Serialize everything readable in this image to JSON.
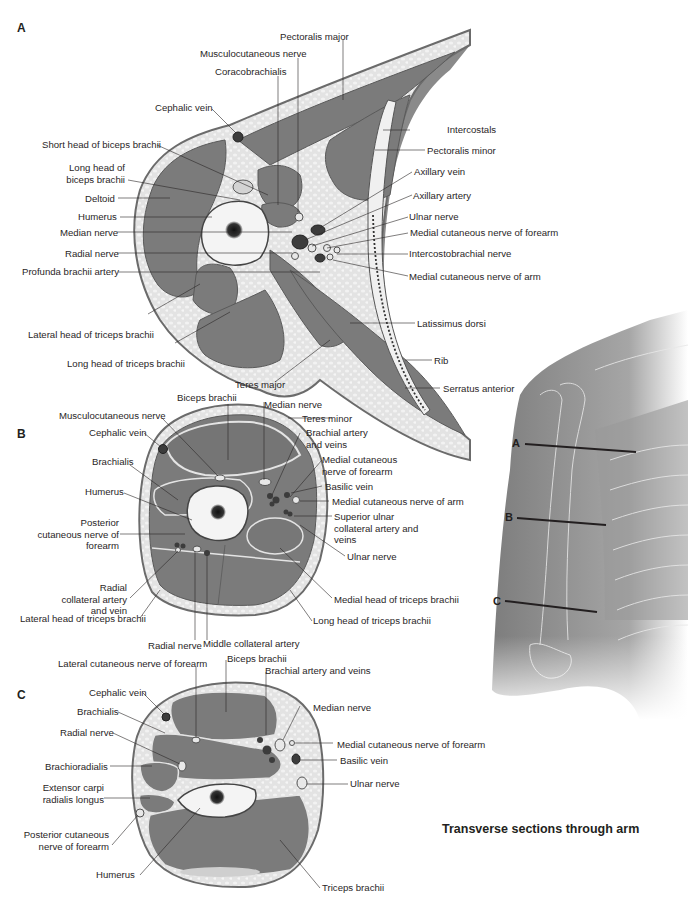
{
  "figure": {
    "title": "Transverse sections through arm",
    "colors": {
      "muscle": "#7b7b7b",
      "muscle_dark": "#6e6e6e",
      "fat": "#d9d9d9",
      "skin": "#8a8a8a",
      "bone": "#f4f4f4",
      "marrow": "#1f1f1f",
      "vessel": "#3c3c3c",
      "nerve": "#e8e8e8",
      "arm_skin": "#8c8c8c"
    }
  },
  "section_a": {
    "letter": "A",
    "labels": {
      "pectoralis_major": "Pectoralis major",
      "musculocutaneous_nerve": "Musculocutaneous nerve",
      "coracobrachialis": "Coracobrachialis",
      "cephalic_vein": "Cephalic vein",
      "short_head_biceps": "Short head of biceps brachii",
      "long_head_biceps": "Long head of biceps brachii",
      "deltoid": "Deltoid",
      "humerus": "Humerus",
      "median_nerve": "Median nerve",
      "radial_nerve": "Radial nerve",
      "profunda_brachii_artery": "Profunda brachii artery",
      "lateral_head_triceps": "Lateral head of triceps brachii",
      "long_head_triceps": "Long head of triceps brachii",
      "teres_major": "Teres major",
      "intercostals": "Intercostals",
      "pectoralis_minor": "Pectoralis minor",
      "axillary_vein": "Axillary vein",
      "axillary_artery": "Axillary artery",
      "ulnar_nerve": "Ulnar nerve",
      "medial_cutaneous_nerve_forearm": "Medial cutaneous nerve of forearm",
      "intercostobrachial_nerve": "Intercostobrachial nerve",
      "medial_cutaneous_nerve_arm": "Medial cutaneous nerve of arm",
      "latissimus_dorsi": "Latissimus dorsi",
      "rib": "Rib",
      "serratus_anterior": "Serratus anterior"
    }
  },
  "section_b": {
    "letter": "B",
    "labels": {
      "biceps_brachii": "Biceps brachii",
      "musculocutaneous_nerve": "Musculocutaneous nerve",
      "cephalic_vein": "Cephalic vein",
      "brachialis": "Brachialis",
      "humerus": "Humerus",
      "posterior_cutaneous_nerve_forearm": "Posterior cutaneous nerve of forearm",
      "radial_collateral_artery_vein": "Radial collateral artery and vein",
      "lateral_head_triceps": "Lateral head of triceps brachii",
      "radial_nerve": "Radial nerve",
      "middle_collateral_artery": "Middle collateral artery",
      "median_nerve": "Median nerve",
      "teres_minor": "Teres minor",
      "brachial_artery_veins": "Brachial artery and veins",
      "medial_cutaneous_nerve_forearm": "Medial cutaneous nerve of forearm",
      "basilic_vein": "Basilic vein",
      "medial_cutaneous_nerve_arm": "Medial cutaneous nerve of arm",
      "superior_ulnar_collateral": "Superior ulnar collateral artery and veins",
      "ulnar_nerve": "Ulnar nerve",
      "medial_head_triceps": "Medial head of triceps brachii",
      "long_head_triceps": "Long head of triceps brachii"
    }
  },
  "section_c": {
    "letter": "C",
    "labels": {
      "lateral_cutaneous_nerve_forearm": "Lateral cutaneous nerve of forearm",
      "biceps_brachii": "Biceps brachii",
      "brachial_artery_veins": "Brachial artery and veins",
      "cephalic_vein": "Cephalic vein",
      "brachialis": "Brachialis",
      "radial_nerve": "Radial nerve",
      "brachioradialis": "Brachioradialis",
      "extensor_carpi_radialis_longus": "Extensor carpi radialis longus",
      "posterior_cutaneous_nerve_forearm": "Posterior cutaneous nerve of forearm",
      "humerus": "Humerus",
      "median_nerve": "Median nerve",
      "medial_cutaneous_nerve_forearm": "Medial cutaneous nerve of forearm",
      "basilic_vein": "Basilic vein",
      "ulnar_nerve": "Ulnar nerve",
      "triceps_brachii": "Triceps brachii"
    }
  },
  "reference_arm": {
    "levels": [
      "A",
      "B",
      "C"
    ]
  }
}
